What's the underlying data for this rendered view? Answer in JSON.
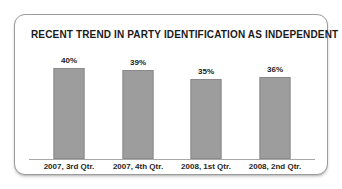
{
  "card": {
    "border_color": "#9c9c9c",
    "background": "#ffffff"
  },
  "chart_data": {
    "type": "bar",
    "title": "RECENT TREND IN PARTY IDENTIFICATION AS INDEPENDENT",
    "subtitle": "",
    "xlabel": "",
    "ylabel": "",
    "categories": [
      "2007, 3rd Qtr.",
      "2007, 4th Qtr.",
      "2008, 1st Qtr.",
      "2008, 2nd Qtr."
    ],
    "values": [
      40,
      39,
      35,
      36
    ],
    "value_labels": [
      "40%",
      "39%",
      "35%",
      "36%"
    ],
    "ylim": [
      0,
      44
    ],
    "grid": false,
    "legend": false,
    "bar_color": "#9d9d9d",
    "bar_border_color": "#8a8a8a",
    "axis_color": "#a8a8a8"
  }
}
